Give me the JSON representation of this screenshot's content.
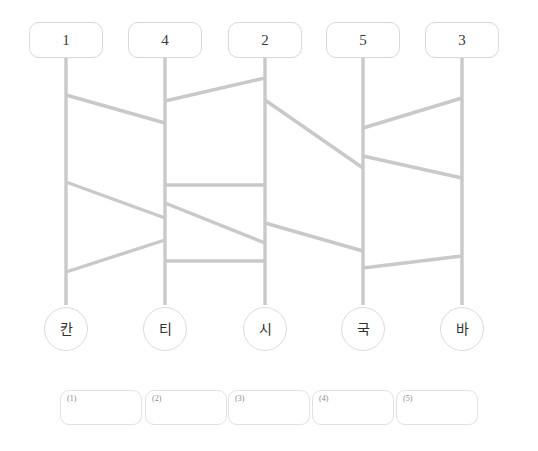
{
  "canvas": {
    "width": 538,
    "height": 451,
    "background": "#ffffff"
  },
  "colors": {
    "line": "#c9c9c9",
    "box_border": "#d9d9d9",
    "circle_border": "#dcdcdc",
    "answer_border": "#e2e2e2",
    "text": "#2f2f2f",
    "index_text": "#8a8a8a"
  },
  "puzzle": {
    "type": "ghost-leg-ladder",
    "lane_count": 5,
    "top_labels": [
      "1",
      "4",
      "2",
      "5",
      "3"
    ],
    "bottom_labels": [
      "칸",
      "티",
      "시",
      "국",
      "바"
    ],
    "answer_indices": [
      "(1)",
      "(2)",
      "(3)",
      "(4)",
      "(5)"
    ],
    "answer_values": [
      "",
      "",
      "",
      "",
      ""
    ]
  },
  "geometry": {
    "rail_x": [
      66,
      165,
      265,
      363,
      462
    ],
    "rail_top_y": 58,
    "rail_bottom_y": 305,
    "top_box": {
      "width": 74,
      "height": 36,
      "y": 22
    },
    "foot_circle": {
      "diameter": 44,
      "y": 307
    },
    "answer_box": {
      "width": 82,
      "height": 35,
      "y": 390,
      "x": [
        60,
        145,
        228,
        312,
        396
      ]
    }
  },
  "rungs": [
    {
      "from_lane": 0,
      "to_lane": 1,
      "y_from": 95,
      "y_to": 123
    },
    {
      "from_lane": 1,
      "to_lane": 2,
      "y_from": 101,
      "y_to": 78
    },
    {
      "from_lane": 2,
      "to_lane": 3,
      "y_from": 100,
      "y_to": 168
    },
    {
      "from_lane": 3,
      "to_lane": 4,
      "y_from": 128,
      "y_to": 98
    },
    {
      "from_lane": 3,
      "to_lane": 4,
      "y_from": 156,
      "y_to": 178
    },
    {
      "from_lane": 0,
      "to_lane": 1,
      "y_from": 182,
      "y_to": 218
    },
    {
      "from_lane": 1,
      "to_lane": 2,
      "y_from": 185,
      "y_to": 185
    },
    {
      "from_lane": 1,
      "to_lane": 2,
      "y_from": 203,
      "y_to": 243
    },
    {
      "from_lane": 2,
      "to_lane": 3,
      "y_from": 223,
      "y_to": 251
    },
    {
      "from_lane": 0,
      "to_lane": 1,
      "y_from": 272,
      "y_to": 240
    },
    {
      "from_lane": 1,
      "to_lane": 2,
      "y_from": 261,
      "y_to": 261
    },
    {
      "from_lane": 3,
      "to_lane": 4,
      "y_from": 268,
      "y_to": 256
    }
  ]
}
